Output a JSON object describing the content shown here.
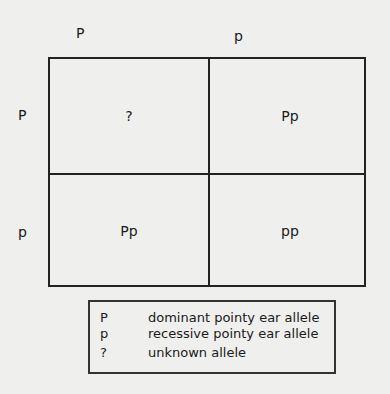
{
  "top_alleles": [
    "P",
    "p"
  ],
  "side_alleles": [
    "P",
    "p"
  ],
  "cells": [
    [
      "?",
      "Pp"
    ],
    [
      "Pp",
      "pp"
    ]
  ],
  "legend": [
    {
      "symbol": "P",
      "text": "dominant pointy ear allele"
    },
    {
      "symbol": "p",
      "text": "recessive pointy ear allele"
    },
    {
      "symbol": "?",
      "text": "unknown allele"
    }
  ]
}
